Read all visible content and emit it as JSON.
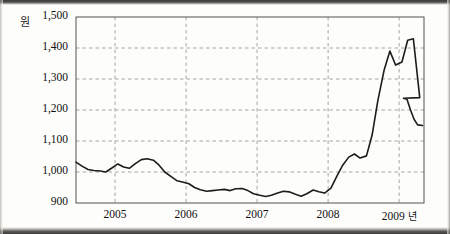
{
  "chart_data": {
    "type": "line",
    "title": "",
    "xlabel": "년",
    "ylabel": "원",
    "unit_label": "원",
    "x_unit_suffix": "년",
    "ylim": [
      900,
      1500
    ],
    "yticks": [
      900,
      1000,
      1100,
      1200,
      1300,
      1400,
      1500
    ],
    "ytick_labels": [
      "900",
      "1,000",
      "1,100",
      "1,200",
      "1,300",
      "1,400",
      "1,500"
    ],
    "xticks": [
      2005,
      2006,
      2007,
      2008,
      2009
    ],
    "xtick_labels": [
      "2005",
      "2006",
      "2007",
      "2008",
      "2009"
    ],
    "xlim": [
      2004.45,
      2009.35
    ],
    "grid": true,
    "grid_style": "dashed",
    "legend": null,
    "series_color": "#1c1c1c",
    "line_width": 1.6,
    "x": [
      2004.45,
      2004.54,
      2004.62,
      2004.7,
      2004.79,
      2004.87,
      2004.95,
      2005.04,
      2005.12,
      2005.2,
      2005.29,
      2005.37,
      2005.45,
      2005.54,
      2005.62,
      2005.7,
      2005.79,
      2005.87,
      2005.95,
      2006.04,
      2006.12,
      2006.2,
      2006.29,
      2006.37,
      2006.45,
      2006.54,
      2006.62,
      2006.7,
      2006.79,
      2006.87,
      2006.95,
      2007.04,
      2007.12,
      2007.2,
      2007.29,
      2007.37,
      2007.45,
      2007.54,
      2007.62,
      2007.7,
      2007.79,
      2007.87,
      2007.95,
      2008.04,
      2008.12,
      2008.2,
      2008.29,
      2008.37,
      2008.45,
      2008.54,
      2008.62,
      2008.7,
      2008.79,
      2008.87,
      2008.95,
      2009.04,
      2009.12,
      2009.2,
      2009.29
    ],
    "values": [
      1032,
      1018,
      1008,
      1005,
      1003,
      1000,
      1012,
      1026,
      1016,
      1012,
      1028,
      1040,
      1043,
      1038,
      1022,
      1000,
      985,
      972,
      968,
      962,
      950,
      943,
      938,
      940,
      942,
      944,
      940,
      946,
      947,
      940,
      930,
      925,
      921,
      925,
      932,
      938,
      936,
      928,
      922,
      930,
      942,
      936,
      932,
      948,
      985,
      1020,
      1048,
      1058,
      1045,
      1052,
      1120,
      1230,
      1330,
      1390,
      1345,
      1355,
      1425,
      1430,
      1240
    ],
    "values_tail": [
      1238,
      1235,
      1200,
      1170,
      1152,
      1150
    ],
    "x_tail": [
      2009.06,
      2009.11,
      2009.16,
      2009.21,
      2009.26,
      2009.33
    ],
    "annotations": []
  },
  "axes": {
    "plot_left_px": 76,
    "plot_right_px": 424,
    "plot_top_px": 17,
    "plot_bottom_px": 203
  }
}
